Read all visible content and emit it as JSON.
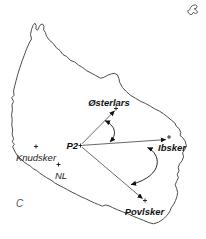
{
  "figure": {
    "panel_label": "C",
    "labels": {
      "p2": "P2",
      "osterlars": "Østerlars",
      "ibsker": "Ibsker",
      "povlsker": "Povlsker",
      "knudsker": "Knudsker",
      "nl": "NL"
    },
    "arrows": [
      {
        "from": "P2",
        "to": "Østerlars"
      },
      {
        "from": "P2",
        "to": "Ibsker"
      },
      {
        "from": "P2",
        "to": "Povlsker"
      }
    ],
    "angle_arcs": [
      {
        "between": [
          "P2-Østerlars",
          "P2-Ibsker"
        ]
      },
      {
        "between": [
          "P2-Ibsker",
          "P2-Povlsker"
        ]
      }
    ],
    "colors": {
      "background": "#ffffff",
      "coastline": "#4d4d4d",
      "arrow_lines": "#2a2a2a",
      "label_text": "#111111",
      "panel_label_text": "#555555"
    }
  }
}
